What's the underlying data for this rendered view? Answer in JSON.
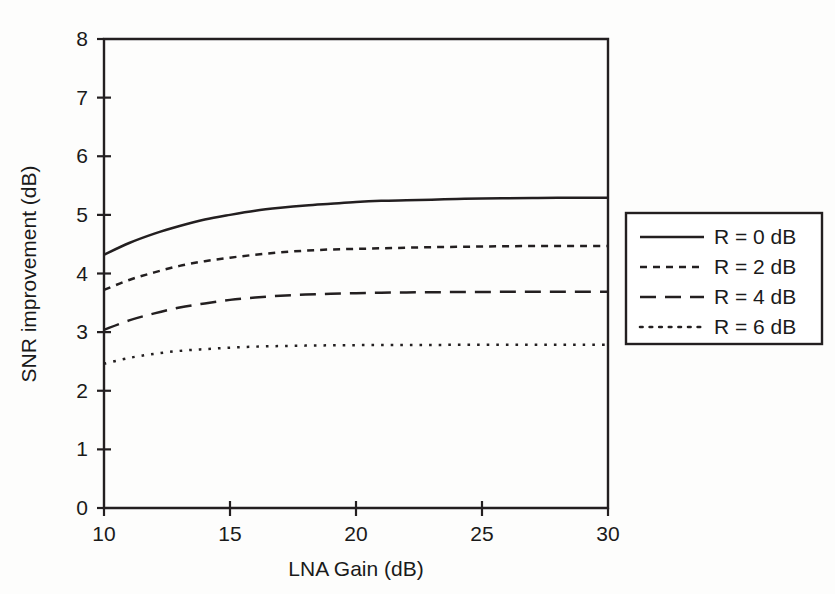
{
  "chart_data": {
    "type": "line",
    "title": "",
    "xlabel": "LNA Gain (dB)",
    "ylabel": "SNR improvement (dB)",
    "xlim": [
      10,
      30
    ],
    "ylim": [
      0,
      8
    ],
    "xticks": [
      10,
      15,
      20,
      25,
      30
    ],
    "yticks": [
      0,
      1,
      2,
      3,
      4,
      5,
      6,
      7,
      8
    ],
    "xticklabels": [
      "10",
      "15",
      "20",
      "25",
      "30"
    ],
    "yticklabels": [
      "0",
      "1",
      "2",
      "3",
      "4",
      "5",
      "6",
      "7",
      "8"
    ],
    "grid": false,
    "legend_position": "right-outside",
    "x": [
      10,
      11,
      12,
      13,
      14,
      15,
      16,
      17,
      18,
      19,
      20,
      21,
      22,
      23,
      24,
      25,
      26,
      27,
      28,
      29,
      30
    ],
    "series": [
      {
        "name": "R = 0 dB",
        "style": "solid",
        "values": [
          4.32,
          4.52,
          4.68,
          4.81,
          4.92,
          5.0,
          5.07,
          5.12,
          5.16,
          5.19,
          5.22,
          5.24,
          5.25,
          5.26,
          5.27,
          5.28,
          5.285,
          5.288,
          5.29,
          5.29,
          5.29
        ]
      },
      {
        "name": "R = 2 dB",
        "style": "dashed-short",
        "values": [
          3.72,
          3.89,
          4.02,
          4.13,
          4.21,
          4.27,
          4.32,
          4.36,
          4.39,
          4.41,
          4.42,
          4.43,
          4.44,
          4.45,
          4.455,
          4.46,
          4.465,
          4.468,
          4.47,
          4.47,
          4.47
        ]
      },
      {
        "name": "R = 4 dB",
        "style": "dashed-long",
        "values": [
          3.04,
          3.2,
          3.32,
          3.42,
          3.49,
          3.55,
          3.59,
          3.62,
          3.64,
          3.655,
          3.665,
          3.672,
          3.677,
          3.681,
          3.684,
          3.686,
          3.687,
          3.688,
          3.689,
          3.69,
          3.69
        ]
      },
      {
        "name": "R = 6 dB",
        "style": "dotted",
        "values": [
          2.46,
          2.56,
          2.63,
          2.68,
          2.71,
          2.735,
          2.752,
          2.763,
          2.77,
          2.775,
          2.778,
          2.78,
          2.781,
          2.782,
          2.783,
          2.784,
          2.784,
          2.785,
          2.785,
          2.785,
          2.785
        ]
      }
    ]
  },
  "legend": {
    "entries": [
      {
        "label": "R = 0 dB"
      },
      {
        "label": "R = 2 dB"
      },
      {
        "label": "R = 4 dB"
      },
      {
        "label": "R = 6 dB"
      }
    ]
  },
  "colors": {
    "ink": "#231f20",
    "background": "#fdfdfc"
  }
}
